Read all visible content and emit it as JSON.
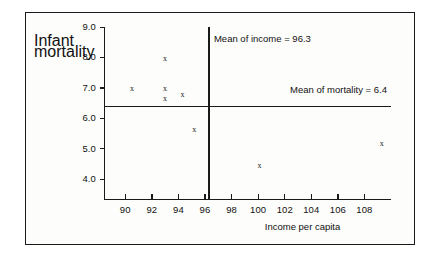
{
  "chart_data": {
    "type": "scatter",
    "title": "",
    "xlabel": "Income per capita",
    "ylabel": "Infant mortality",
    "ylabel_line1": "Infant",
    "ylabel_line2": "mortality",
    "xlim": [
      88.4,
      110.0
    ],
    "ylim": [
      3.35,
      9.0
    ],
    "xticks": [
      90,
      92,
      94,
      96,
      98,
      100,
      102,
      104,
      106,
      108
    ],
    "xticklabels": [
      "90",
      "92",
      "94",
      "96",
      "98",
      "100",
      "102",
      "104",
      "106",
      "108"
    ],
    "yticks": [
      4.0,
      5.0,
      6.0,
      7.0,
      8.0,
      9.0
    ],
    "yticklabels": [
      "4.0",
      "5.0",
      "6.0",
      "7.0",
      "8.0",
      "9.0"
    ],
    "grid": false,
    "legend": null,
    "marker": "x",
    "marker_color": "#1a1a1a",
    "points": [
      {
        "x": 90.5,
        "y": 6.95
      },
      {
        "x": 93.0,
        "y": 7.95
      },
      {
        "x": 93.0,
        "y": 6.95
      },
      {
        "x": 93.0,
        "y": 6.62
      },
      {
        "x": 94.3,
        "y": 6.78
      },
      {
        "x": 95.2,
        "y": 5.62
      },
      {
        "x": 100.1,
        "y": 4.45
      },
      {
        "x": 109.3,
        "y": 5.15
      }
    ],
    "reference_lines": [
      {
        "name": "mean-of-income",
        "orientation": "vertical",
        "value": 96.3,
        "label": "Mean of income = 96.3"
      },
      {
        "name": "mean-of-mortality",
        "orientation": "horizontal",
        "value": 6.4,
        "label": "Mean of mortality = 6.4"
      }
    ],
    "annotations": [
      "Mean of income = 96.3",
      "Mean of mortality = 6.4"
    ]
  }
}
